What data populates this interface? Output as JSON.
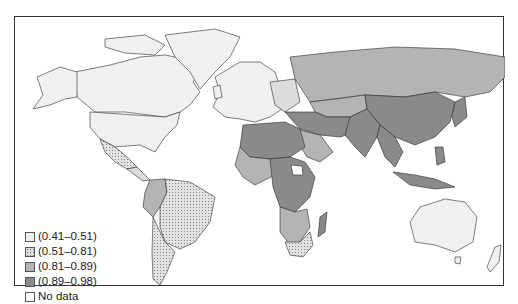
{
  "map": {
    "title": "",
    "type": "choropleth",
    "region": "World",
    "colors": {
      "c1": "#f0f0f0",
      "c2": "#dcdcdc",
      "c3": "#b4b4b4",
      "c4": "#8a8a8a",
      "nodata": "#ffffff",
      "border": "#2a2a2a"
    }
  },
  "legend": {
    "items": [
      {
        "label": "(0.41–0.51)",
        "color": "#f0f0f0",
        "pattern": "none"
      },
      {
        "label": "(0.51–0.81)",
        "color": "#dcdcdc",
        "pattern": "dots"
      },
      {
        "label": "(0.81–0.89)",
        "color": "#b4b4b4",
        "pattern": "none"
      },
      {
        "label": "(0.89–0.98)",
        "color": "#8a8a8a",
        "pattern": "none"
      },
      {
        "label": "No data",
        "color": "#ffffff",
        "pattern": "none"
      }
    ]
  }
}
